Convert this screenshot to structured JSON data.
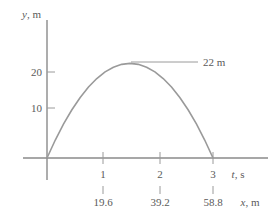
{
  "chart_data": {
    "type": "line",
    "title": "",
    "subtitle": "",
    "xlabel": "t, s",
    "xlabel2": "x, m",
    "ylabel": "y, m",
    "xlim": [
      -0.2,
      3.55
    ],
    "ylim": [
      -2,
      27
    ],
    "grid": false,
    "legend": null,
    "curve_description": "projectile trajectory parabola",
    "x": [
      0,
      0.15,
      0.3,
      0.45,
      0.6,
      0.75,
      0.9,
      1.05,
      1.2,
      1.35,
      1.5,
      1.65,
      1.8,
      1.95,
      2.1,
      2.25,
      2.4,
      2.55,
      2.7,
      2.85,
      3.0
    ],
    "y": [
      0,
      4.18,
      7.92,
      11.22,
      14.08,
      16.5,
      18.48,
      20.02,
      21.12,
      21.78,
      22.0,
      21.78,
      21.12,
      20.02,
      18.48,
      16.5,
      14.08,
      11.22,
      7.92,
      4.18,
      0
    ],
    "y_ticks": [
      {
        "value": 10,
        "label": "10"
      },
      {
        "value": 20,
        "label": "20"
      }
    ],
    "x_ticks": [
      {
        "value": 1,
        "label": "1",
        "label2": "19.6"
      },
      {
        "value": 2,
        "label": "2",
        "label2": "39.2"
      },
      {
        "value": 3,
        "label": "3",
        "label2": "58.8"
      }
    ],
    "annotations": [
      {
        "label": "22 m",
        "at_x": 1.5,
        "at_y": 22,
        "leader": true
      }
    ],
    "peak_value": 22,
    "peak_time": 1.5,
    "flight_time": 3,
    "range_m": 58.8
  },
  "colors": {
    "curve": "#9a9a9a",
    "axis": "#8a8a8a",
    "text": "#5a5a5a",
    "background": "#ffffff"
  }
}
